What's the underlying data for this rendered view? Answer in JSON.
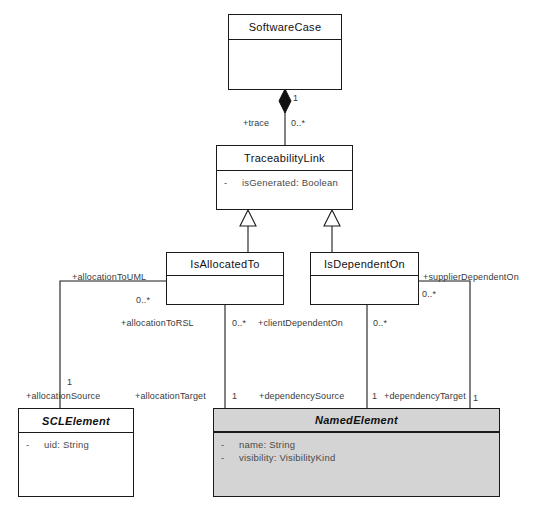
{
  "diagram": {
    "type": "uml-class-diagram",
    "classes": [
      {
        "id": "SoftwareCase",
        "name": "SoftwareCase",
        "abstract": false,
        "shaded": false,
        "attributes": []
      },
      {
        "id": "TraceabilityLink",
        "name": "TraceabilityLink",
        "abstract": false,
        "shaded": false,
        "attributes": [
          {
            "visibility": "-",
            "text": "isGenerated: Boolean"
          }
        ]
      },
      {
        "id": "IsAllocatedTo",
        "name": "IsAllocatedTo",
        "abstract": false,
        "shaded": false,
        "attributes": []
      },
      {
        "id": "IsDependentOn",
        "name": "IsDependentOn",
        "abstract": false,
        "shaded": false,
        "attributes": []
      },
      {
        "id": "SCLElement",
        "name": "SCLElement",
        "abstract": true,
        "shaded": false,
        "attributes": [
          {
            "visibility": "-",
            "text": "uid: String"
          }
        ]
      },
      {
        "id": "NamedElement",
        "name": "NamedElement",
        "abstract": true,
        "shaded": true,
        "attributes": [
          {
            "visibility": "-",
            "text": "name: String"
          },
          {
            "visibility": "-",
            "text": "visibility: VisibilityKind"
          }
        ]
      }
    ],
    "relationships": [
      {
        "kind": "composition",
        "from": "SoftwareCase",
        "to": "TraceabilityLink",
        "source_multiplicity": "1",
        "target_role": "+trace",
        "target_multiplicity": "0..*"
      },
      {
        "kind": "generalization",
        "from": "IsAllocatedTo",
        "to": "TraceabilityLink"
      },
      {
        "kind": "generalization",
        "from": "IsDependentOn",
        "to": "TraceabilityLink"
      },
      {
        "kind": "association",
        "from": "IsAllocatedTo",
        "to": "SCLElement",
        "source_role": "+allocationToUML",
        "source_multiplicity": "0..*",
        "target_role": "+allocationSource",
        "target_multiplicity": "1"
      },
      {
        "kind": "association",
        "from": "IsAllocatedTo",
        "to": "NamedElement",
        "source_role": "+allocationToRSL",
        "source_multiplicity": "0..*",
        "target_role": "+allocationTarget",
        "target_multiplicity": "1"
      },
      {
        "kind": "association",
        "from": "IsDependentOn",
        "to": "NamedElement",
        "source_role": "+clientDependentOn",
        "source_multiplicity": "0..*",
        "target_role": "+dependencySource",
        "target_multiplicity": "1"
      },
      {
        "kind": "association",
        "from": "IsDependentOn",
        "to": "NamedElement",
        "source_role": "+supplierDependentOn",
        "source_multiplicity": "0..*",
        "target_role": "+dependencyTarget",
        "target_multiplicity": "1"
      }
    ],
    "labels": {
      "trace_role": "+trace",
      "trace_mult_one": "1",
      "trace_mult_many": "0..*",
      "allocation_to_uml": "+allocationToUML",
      "allocation_to_uml_mult": "0..*",
      "allocation_to_rsl": "+allocationToRSL",
      "allocation_to_rsl_mult": "0..*",
      "client_dependent_on": "+clientDependentOn",
      "client_dependent_on_mult": "0..*",
      "supplier_dependent_on": "+supplierDependentOn",
      "supplier_dependent_on_mult": "0..*",
      "allocation_source": "+allocationSource",
      "allocation_source_mult": "1",
      "allocation_target": "+allocationTarget",
      "allocation_target_mult": "1",
      "dependency_source": "+dependencySource",
      "dependency_source_mult": "1",
      "dependency_target": "+dependencyTarget",
      "dependency_target_mult": "1"
    },
    "colors": {
      "line": "#1a1a1a",
      "class_fill": "#ffffff",
      "shaded_fill": "#d4d4d4",
      "text": "#111111",
      "attr_text": "#4a4a4a"
    }
  }
}
